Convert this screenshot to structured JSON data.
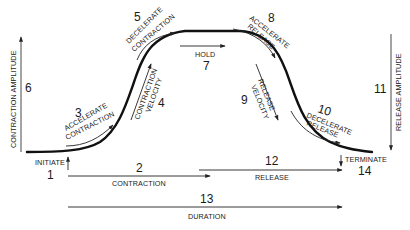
{
  "diagram": {
    "type": "muscle-contraction-profile",
    "segments": [
      {
        "id": 1,
        "label": "INITIATE"
      },
      {
        "id": 2,
        "label": "CONTRACTION"
      },
      {
        "id": 3,
        "label_line1": "ACCELERATE",
        "label_line2": "CONTRACTION"
      },
      {
        "id": 4,
        "label_line1": "CONTRACTION",
        "label_line2": "VELOCITY"
      },
      {
        "id": 5,
        "label_line1": "DECELERATE",
        "label_line2": "CONTRACTION"
      },
      {
        "id": 6,
        "label": "CONTRACTION AMPLITUDE"
      },
      {
        "id": 7,
        "label": "HOLD"
      },
      {
        "id": 8,
        "label_line1": "ACCELERATE",
        "label_line2": "RELEASE"
      },
      {
        "id": 9,
        "label_line1": "RELEASE",
        "label_line2": "VELOCITY"
      },
      {
        "id": 10,
        "label_line1": "DECELERATE",
        "label_line2": "RELEASE"
      },
      {
        "id": 11,
        "label": "RELEASE AMPLITUDE"
      },
      {
        "id": 12,
        "label": "RELEASE"
      },
      {
        "id": 13,
        "label": "DURATION"
      },
      {
        "id": 14,
        "label": "TERMINATE"
      }
    ],
    "numbers": {
      "n1": "1",
      "n2": "2",
      "n3": "3",
      "n4": "4",
      "n5": "5",
      "n6": "6",
      "n7": "7",
      "n8": "8",
      "n9": "9",
      "n10": "10",
      "n11": "11",
      "n12": "12",
      "n13": "13",
      "n14": "14"
    },
    "labels": {
      "initiate": "INITIATE",
      "contraction": "CONTRACTION",
      "accelerate_contraction_1": "ACCELERATE",
      "accelerate_contraction_2": "CONTRACTION",
      "contraction_velocity_1": "CONTRACTION",
      "contraction_velocity_2": "VELOCITY",
      "decelerate_contraction_1": "DECELERATE",
      "decelerate_contraction_2": "CONTRACTION",
      "contraction_amplitude": "CONTRACTION AMPLITUDE",
      "hold": "HOLD",
      "accelerate_release_1": "ACCELERATE",
      "accelerate_release_2": "RELEASE",
      "release_velocity_1": "RELEASE",
      "release_velocity_2": "VELOCITY",
      "decelerate_release_1": "DECELERATE",
      "decelerate_release_2": "RELEASE",
      "release_amplitude": "RELEASE AMPLITUDE",
      "release": "RELEASE",
      "duration": "DURATION",
      "terminate": "TERMINATE"
    },
    "colors": {
      "ink": "#111111",
      "background": "#ffffff"
    }
  }
}
